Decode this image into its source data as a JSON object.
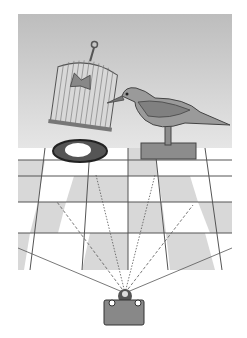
{
  "figure": {
    "colors": {
      "background_wall": "#c8c8c8",
      "floor_light": "#ffffff",
      "floor_dark": "#d8d8d8",
      "grid_line": "#555555",
      "object_fill": "#9a9a9a",
      "outline": "#444444"
    },
    "objects": [
      "birdcage",
      "butterfly",
      "bird-decoy",
      "stand",
      "nest",
      "egg",
      "camera"
    ]
  }
}
